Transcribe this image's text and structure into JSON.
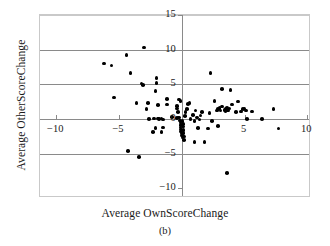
{
  "figure": {
    "panel_caption": "(b)",
    "xlabel": "Average OwnScoreChange",
    "ylabel": "Average OtherScoreChange"
  },
  "chart_data": {
    "type": "scatter",
    "title": "",
    "xlabel": "Average OwnScoreChange",
    "ylabel": "Average OtherScoreChange",
    "xlim": [
      -11.3,
      10.3
    ],
    "ylim": [
      -11.4,
      15.0
    ],
    "xticks": [
      -10,
      -5,
      5,
      10
    ],
    "xtick_labels": [
      "-10",
      "-5",
      "5",
      "10"
    ],
    "yticks": [
      15,
      10,
      5,
      0,
      -5,
      -10
    ],
    "ytick_labels": [
      "15",
      "10",
      "5",
      "0",
      "-5",
      "-10"
    ],
    "gridlines_y": [
      15,
      10,
      5,
      0,
      -5
    ],
    "grid": true,
    "grid_axis": "y",
    "legend": null,
    "marker": "filled-circle",
    "marker_color": "#000000",
    "points": [
      [
        -3.0,
        10.3
      ],
      [
        -4.4,
        9.2
      ],
      [
        -6.2,
        8.0
      ],
      [
        -5.6,
        7.7
      ],
      [
        -4.1,
        6.6
      ],
      [
        -2.0,
        5.9
      ],
      [
        -2.0,
        5.2
      ],
      [
        -3.2,
        5.1
      ],
      [
        -3.1,
        4.9
      ],
      [
        -2.1,
        4.0
      ],
      [
        -5.4,
        3.1
      ],
      [
        -1.2,
        2.9
      ],
      [
        -0.2,
        2.8
      ],
      [
        -0.1,
        2.6
      ],
      [
        -3.6,
        2.3
      ],
      [
        -2.7,
        2.3
      ],
      [
        -1.9,
        2.0
      ],
      [
        -1.2,
        2.1
      ],
      [
        -0.4,
        1.9
      ],
      [
        -0.4,
        1.5
      ],
      [
        -2.8,
        1.4
      ],
      [
        -0.3,
        1.0
      ],
      [
        -2.2,
        0.05
      ],
      [
        -1.9,
        0.05
      ],
      [
        -1.6,
        0.05
      ],
      [
        -0.8,
        0.3
      ],
      [
        -0.4,
        0.1
      ],
      [
        -0.2,
        0.2
      ],
      [
        -0.15,
        -0.2
      ],
      [
        -0.1,
        -0.5
      ],
      [
        -0.1,
        -0.9
      ],
      [
        -0.1,
        -1.2
      ],
      [
        -0.05,
        -1.5
      ],
      [
        -0.05,
        -1.8
      ],
      [
        0.0,
        -2.1
      ],
      [
        0.0,
        -2.4
      ],
      [
        0.05,
        -2.7
      ],
      [
        0.05,
        -0.3
      ],
      [
        0.1,
        -0.7
      ],
      [
        0.1,
        -1.1
      ],
      [
        0.15,
        -1.6
      ],
      [
        0.15,
        -2.0
      ],
      [
        0.2,
        -2.5
      ],
      [
        0.2,
        -3.0
      ],
      [
        0.25,
        0.4
      ],
      [
        0.3,
        1.0
      ],
      [
        0.4,
        1.4
      ],
      [
        0.5,
        2.2
      ],
      [
        0.6,
        2.3
      ],
      [
        0.7,
        0.0
      ],
      [
        0.9,
        0.6
      ],
      [
        1.0,
        -0.3
      ],
      [
        1.1,
        1.2
      ],
      [
        1.2,
        0.2
      ],
      [
        1.3,
        -1.3
      ],
      [
        1.4,
        -0.1
      ],
      [
        1.5,
        0.5
      ],
      [
        1.6,
        1.0
      ],
      [
        -1.5,
        -1.2
      ],
      [
        -1.6,
        -1.9
      ],
      [
        -2.1,
        -1.3
      ],
      [
        -2.3,
        -1.9
      ],
      [
        -1.5,
        -0.1
      ],
      [
        -1.8,
        0.0
      ],
      [
        -2.6,
        0.0
      ],
      [
        -4.3,
        -4.6
      ],
      [
        -3.4,
        -5.5
      ],
      [
        1.0,
        -3.3
      ],
      [
        1.8,
        -3.3
      ],
      [
        2.1,
        -1.4
      ],
      [
        2.4,
        -0.3
      ],
      [
        2.6,
        2.6
      ],
      [
        2.8,
        1.2
      ],
      [
        2.9,
        1.4
      ],
      [
        3.0,
        1.6
      ],
      [
        3.1,
        1.2
      ],
      [
        3.2,
        1.8
      ],
      [
        3.2,
        4.3
      ],
      [
        3.4,
        1.3
      ],
      [
        3.5,
        1.5
      ],
      [
        3.5,
        1.1
      ],
      [
        3.6,
        1.6
      ],
      [
        3.6,
        1.3
      ],
      [
        3.7,
        1.2
      ],
      [
        3.8,
        1.5
      ],
      [
        3.9,
        4.2
      ],
      [
        4.0,
        2.1
      ],
      [
        2.3,
        6.6
      ],
      [
        4.3,
        1.0
      ],
      [
        4.5,
        2.5
      ],
      [
        4.7,
        1.1
      ],
      [
        4.9,
        1.4
      ],
      [
        5.0,
        1.5
      ],
      [
        5.1,
        1.2
      ],
      [
        5.2,
        0.0
      ],
      [
        5.6,
        1.1
      ],
      [
        6.4,
        0.0
      ],
      [
        7.3,
        1.4
      ],
      [
        7.7,
        -1.4
      ],
      [
        3.6,
        -7.8
      ],
      [
        2.9,
        -1.0
      ],
      [
        2.2,
        0.9
      ]
    ]
  }
}
